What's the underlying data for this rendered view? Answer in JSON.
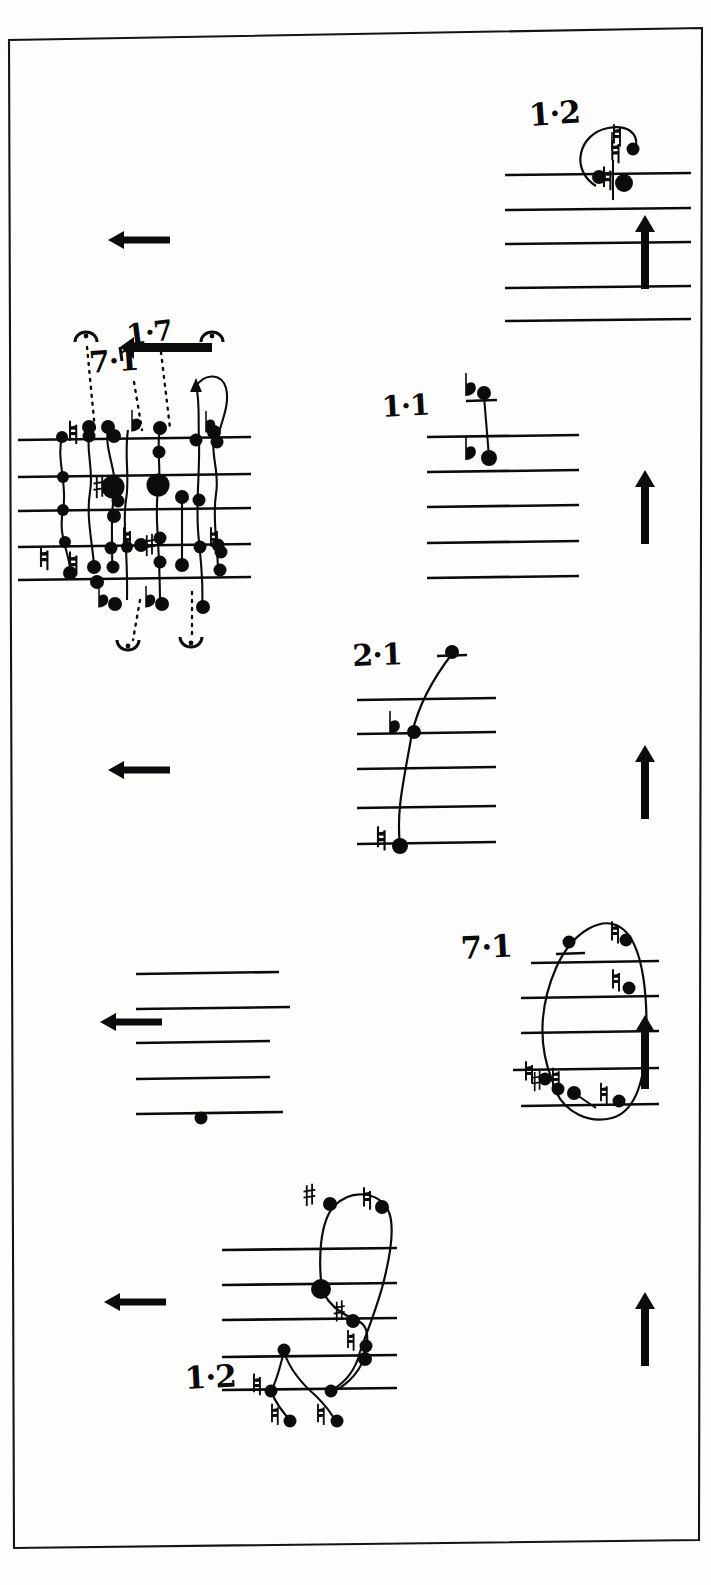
{
  "page": {
    "kind": "handwritten-music-sketch",
    "width": 711,
    "height": 1585,
    "ink_color": "#0b0b0b",
    "paper_color": "#fdfdfc",
    "border": "thin black rectangle, slightly rotated (scanned page edge)"
  },
  "labels": {
    "top_right_staff": "1·2",
    "dense_staff_top": "1·7",
    "dense_staff_left": "7·1",
    "middle_right_staff": "1·1",
    "lower_middle_staff": "2·1",
    "loop_staff": "7·1",
    "bottom_staff": "1·2"
  },
  "systems": [
    {
      "id": "system-1",
      "label": "1·2",
      "staff_lines_y": [
        175,
        210,
        244,
        288,
        321
      ],
      "staff_x": [
        505,
        690
      ],
      "direction_arrow_left": {
        "present": true,
        "x": 108,
        "y": 240,
        "length": 62
      },
      "direction_arrow_right": {
        "present": true,
        "x": 641,
        "y": 215,
        "length": 78,
        "direction": "up"
      },
      "notes": [
        {
          "head": "filled-small",
          "x": 630,
          "y": 148,
          "accidental": "natural"
        },
        {
          "head": "filled-large",
          "x": 623,
          "y": 182,
          "accidental": "natural"
        },
        {
          "head": "filled-small",
          "x": 600,
          "y": 178,
          "accidental": "none"
        }
      ],
      "contour": "loop/slur arcing up and left over the noteheads"
    },
    {
      "id": "system-2",
      "label_top": "1·7",
      "label_left": "7·1",
      "staff_lines_y": [
        440,
        477,
        511,
        547,
        580
      ],
      "staff_x": [
        18,
        250
      ],
      "direction_arrow_left": {
        "present": true,
        "x": 108,
        "y": 240,
        "length": 62
      },
      "inline_arrow": {
        "present": true,
        "x": 120,
        "y": 347,
        "length": 92,
        "direction": "left"
      },
      "fermatas": [
        {
          "x": 86,
          "y": 334
        },
        {
          "x": 212,
          "y": 334
        },
        {
          "x": 128,
          "y": 646
        },
        {
          "x": 190,
          "y": 643
        }
      ],
      "dotted_leaders": [
        {
          "from_x": 88,
          "from_y": 345,
          "to_x": 98,
          "to_y": 430
        },
        {
          "from_x": 136,
          "from_y": 380,
          "to_x": 146,
          "to_y": 430
        },
        {
          "from_x": 162,
          "from_y": 352,
          "to_x": 172,
          "to_y": 428
        },
        {
          "from_x": 147,
          "from_y": 598,
          "to_x": 135,
          "to_y": 640
        },
        {
          "from_x": 192,
          "from_y": 590,
          "to_x": 192,
          "to_y": 636
        }
      ],
      "accidentals": [
        "natural",
        "flat",
        "sharp",
        "natural",
        "natural",
        "flat",
        "flat",
        "sharp",
        "natural",
        "flat",
        "natural"
      ],
      "note_count": 34,
      "density": "very dense cluster of noteheads with connecting curved contour lines"
    },
    {
      "id": "system-3",
      "label": "1·1",
      "staff_lines_y": [
        437,
        472,
        507,
        543,
        578
      ],
      "staff_x": [
        427,
        578
      ],
      "direction_arrow_right": {
        "present": true,
        "x": 641,
        "y": 470,
        "length": 78,
        "direction": "up"
      },
      "ledger_line": {
        "x": 465,
        "y": 400,
        "width": 32
      },
      "notes": [
        {
          "head": "filled",
          "x": 484,
          "y": 392,
          "accidental": "flat"
        },
        {
          "head": "filled",
          "x": 488,
          "y": 457,
          "accidental": "flat"
        }
      ],
      "contour": "single near-vertical stem joining the two notes"
    },
    {
      "id": "system-4",
      "label": "2·1",
      "staff_lines_y": [
        699,
        733,
        768,
        808,
        843
      ],
      "staff_x": [
        357,
        495
      ],
      "direction_arrow_left": {
        "present": true,
        "x": 108,
        "y": 770,
        "length": 62
      },
      "direction_arrow_right": {
        "present": true,
        "x": 641,
        "y": 745,
        "length": 78,
        "direction": "up"
      },
      "ledger_line": {
        "x": 436,
        "y": 655,
        "width": 30
      },
      "notes": [
        {
          "head": "filled",
          "x": 452,
          "y": 651,
          "accidental": "none"
        },
        {
          "head": "filled",
          "x": 414,
          "y": 731,
          "accidental": "flat"
        },
        {
          "head": "filled",
          "x": 400,
          "y": 845,
          "accidental": "natural"
        }
      ],
      "contour": "rising line from bottom-left note up through flat to the ledger note"
    },
    {
      "id": "system-5",
      "label": "",
      "staff_lines_y": [
        974,
        1009,
        1043,
        1079,
        1114
      ],
      "staff_x": [
        164,
        285
      ],
      "direction_arrow_left": {
        "present": true,
        "x": 100,
        "y": 1022,
        "length": 70
      },
      "notes": [
        {
          "head": "filled",
          "x": 201,
          "y": 1117,
          "accidental": "none"
        }
      ],
      "contour": "empty staff with one notehead on the bottom line"
    },
    {
      "id": "system-6",
      "label": "7·1",
      "staff_lines_y": [
        963,
        997,
        1033,
        1069,
        1106
      ],
      "staff_x": [
        508,
        660
      ],
      "direction_arrow_right": {
        "present": true,
        "x": 641,
        "y": 1015,
        "length": 72,
        "direction": "up"
      },
      "ledger_line": {
        "x": 562,
        "y": 954,
        "width": 28
      },
      "notes": [
        {
          "head": "filled",
          "x": 569,
          "y": 941,
          "accidental": "none"
        },
        {
          "head": "filled",
          "x": 625,
          "y": 940,
          "accidental": "natural"
        },
        {
          "head": "filled",
          "x": 628,
          "y": 987,
          "accidental": "natural"
        },
        {
          "head": "filled",
          "x": 545,
          "y": 1079,
          "accidental": "natural"
        },
        {
          "head": "filled",
          "x": 556,
          "y": 1089,
          "accidental": "sharp"
        },
        {
          "head": "filled",
          "x": 573,
          "y": 1092,
          "accidental": "natural"
        },
        {
          "head": "filled",
          "x": 618,
          "y": 1100,
          "accidental": "natural"
        }
      ],
      "contour": "large closed teardrop loop enclosing the staff"
    },
    {
      "id": "system-7",
      "label": "1·2",
      "staff_lines_y": [
        1250,
        1285,
        1320,
        1357,
        1390
      ],
      "staff_x": [
        222,
        395
      ],
      "direction_arrow_left": {
        "present": true,
        "x": 104,
        "y": 1302,
        "length": 64
      },
      "direction_arrow_right": {
        "present": true,
        "x": 641,
        "y": 1292,
        "length": 76,
        "direction": "up"
      },
      "notes": [
        {
          "head": "filled",
          "x": 329,
          "y": 1203,
          "accidental": "sharp"
        },
        {
          "head": "filled",
          "x": 381,
          "y": 1206,
          "accidental": "natural"
        },
        {
          "head": "filled-large",
          "x": 320,
          "y": 1288,
          "accidental": "none"
        },
        {
          "head": "filled",
          "x": 352,
          "y": 1320,
          "accidental": "sharp"
        },
        {
          "head": "filled",
          "x": 366,
          "y": 1345,
          "accidental": "natural"
        },
        {
          "head": "filled",
          "x": 364,
          "y": 1358,
          "accidental": "none"
        },
        {
          "head": "filled",
          "x": 284,
          "y": 1350,
          "accidental": "none"
        },
        {
          "head": "filled",
          "x": 271,
          "y": 1390,
          "accidental": "natural"
        },
        {
          "head": "filled",
          "x": 330,
          "y": 1390,
          "accidental": "none"
        },
        {
          "head": "filled",
          "x": 290,
          "y": 1420,
          "accidental": "natural"
        },
        {
          "head": "filled",
          "x": 336,
          "y": 1420,
          "accidental": "natural"
        }
      ],
      "contour": "closed loop plus descending zig-zag tails below the staff"
    }
  ],
  "glyphs": {
    "flat": "♭",
    "natural": "♮",
    "sharp": "♯",
    "fermata": "⁀",
    "arrow_left": "←",
    "arrow_up": "↑"
  }
}
